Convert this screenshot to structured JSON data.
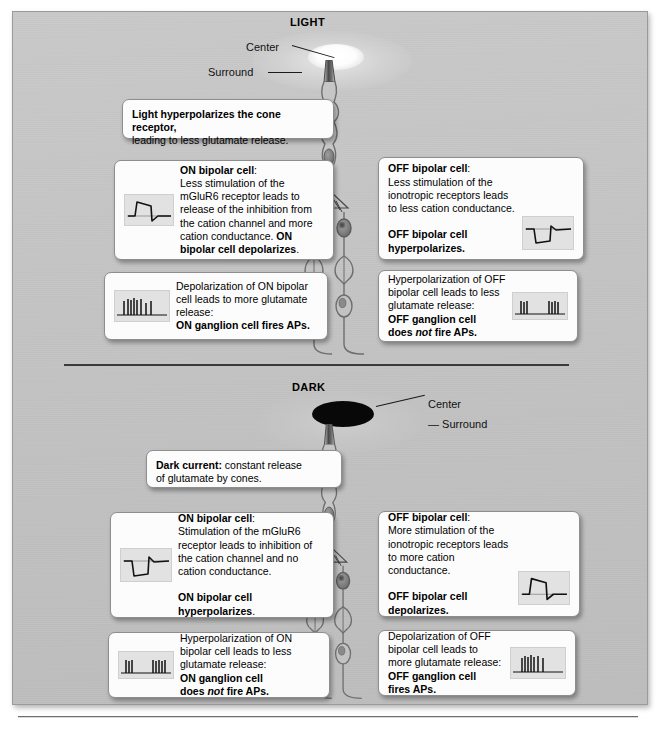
{
  "figure": {
    "sections": {
      "light": {
        "label": "LIGHT"
      },
      "dark": {
        "label": "DARK"
      }
    }
  },
  "receptive_field": {
    "light": {
      "center_label": "Center",
      "surround_label": "Surround",
      "center_color": "#ffffff",
      "surround_color": "#d8d8d8"
    },
    "dark": {
      "center_label": "Center",
      "surround_label": "— Surround",
      "center_color": "#080808",
      "surround_color": "#cccccc"
    }
  },
  "boxes": {
    "cone_light": {
      "line1_bold": "Light hyperpolarizes the cone receptor,",
      "line2": "leading to less glutamate release."
    },
    "on_bipolar_light": {
      "heading_bold": "ON bipolar cell",
      "heading_colon": ":",
      "body": "Less stimulation of the mGluR6 receptor leads to release of the inhibition from the cation channel and more cation conductance.",
      "conclusion_bold": "ON bipolar cell depolarizes",
      "conclusion_end": ".",
      "inset": "depolarizing-waveform"
    },
    "off_bipolar_light": {
      "heading_bold": "OFF bipolar cell",
      "heading_colon": ":",
      "body": "Less stimulation of the ionotropic receptors leads to less cation conductance.",
      "conclusion_bold": "OFF bipolar cell hyperpolarizes.",
      "inset": "hyperpolarizing-waveform"
    },
    "on_ganglion_light": {
      "body": "Depolarization of ON bipolar cell leads to more glutamate release:",
      "conclusion_bold": "ON ganglion cell fires APs.",
      "inset": "spike-train-burst"
    },
    "off_ganglion_light": {
      "body": "Hyperpolarization of OFF bipolar cell leads to less glutamate release:",
      "conclusion_bold_1": "OFF ganglion cell",
      "conclusion_bold_2": "does ",
      "conclusion_italic": "not",
      "conclusion_bold_3": " fire APs.",
      "inset": "spike-train-sparse"
    },
    "dark_current": {
      "line1_bold": "Dark current:",
      "line1_rest": " constant release",
      "line2": "of glutamate by cones."
    },
    "on_bipolar_dark": {
      "heading_bold": "ON bipolar cell",
      "heading_colon": ":",
      "body": "Stimulation of the mGluR6 receptor leads to inhibition of the cation channel and no cation conductance.",
      "conclusion_bold": "ON bipolar cell hyperpolarizes",
      "conclusion_end": ".",
      "inset": "hyperpolarizing-waveform"
    },
    "off_bipolar_dark": {
      "heading_bold": "OFF bipolar cell",
      "heading_colon": ":",
      "body": "More stimulation of the ionotropic receptors leads to more cation conductance.",
      "conclusion_bold": "OFF bipolar cell depolarizes.",
      "inset": "depolarizing-waveform"
    },
    "on_ganglion_dark": {
      "body": "Hyperpolarization of ON bipolar cell leads to less glutamate release:",
      "conclusion_bold_1": "ON ganglion cell",
      "conclusion_bold_2": "does ",
      "conclusion_italic": "not",
      "conclusion_bold_3": " fire APs.",
      "inset": "spike-train-sparse"
    },
    "off_ganglion_dark": {
      "body": "Depolarization of OFF bipolar cell leads to more glutamate release:",
      "conclusion_bold_1": "OFF ganglion cell",
      "conclusion_bold_2": "fires APs.",
      "inset": "spike-train-burst"
    }
  },
  "circuit": {
    "cells": [
      "cone-photoreceptor",
      "on-bipolar-cell",
      "off-bipolar-cell",
      "on-ganglion-cell",
      "off-ganglion-cell"
    ],
    "outline_color": "#6e6e6e",
    "soma_color": "#8c8c8c"
  }
}
